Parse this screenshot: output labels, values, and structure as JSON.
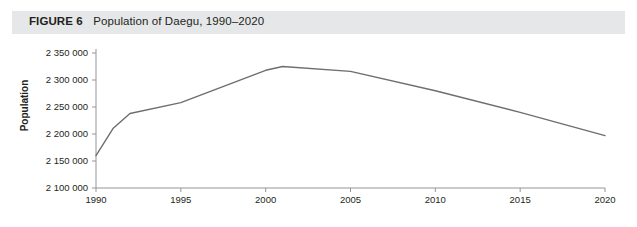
{
  "figure": {
    "label": "FIGURE 6",
    "title": "Population of Daegu, 1990–2020",
    "band_color": "#e6e7e9",
    "text_color": "#231f20"
  },
  "chart_data": {
    "type": "line",
    "title": "Population of Daegu, 1990–2020",
    "xlabel": "",
    "ylabel": "Population",
    "xlim": [
      1990,
      2020
    ],
    "ylim": [
      2100000,
      2350000
    ],
    "ytick_step": 50000,
    "grid": false,
    "legend": null,
    "line_color": "#6d6e71",
    "axis_color": "#939598",
    "xticks": [
      1990,
      1995,
      2000,
      2005,
      2010,
      2015,
      2020
    ],
    "xtick_labels": [
      "1990",
      "1995",
      "2000",
      "2005",
      "2010",
      "2015",
      "2020"
    ],
    "yticks": [
      2100000,
      2150000,
      2200000,
      2250000,
      2300000,
      2350000
    ],
    "ytick_labels": [
      "2 100 000",
      "2 150 000",
      "2 200 000",
      "2 250 000",
      "2 300 000",
      "2 350 000"
    ],
    "series": [
      {
        "name": "Population of Daegu",
        "x": [
          1990,
          1991,
          1992,
          1995,
          2000,
          2001,
          2005,
          2010,
          2015,
          2020
        ],
        "values": [
          2160000,
          2210000,
          2238000,
          2258000,
          2318000,
          2325000,
          2316000,
          2280000,
          2240000,
          2197000
        ]
      }
    ]
  }
}
